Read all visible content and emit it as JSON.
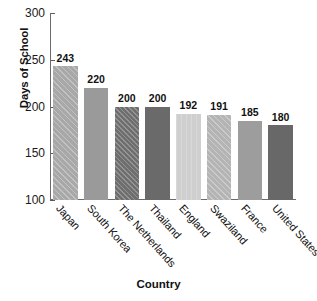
{
  "chart_data": {
    "type": "bar",
    "title": "",
    "xlabel": "Country",
    "ylabel": "Days of School",
    "categories": [
      "Japan",
      "South Korea",
      "The Netherlands",
      "Thailand",
      "England",
      "Swaziland",
      "France",
      "United States"
    ],
    "values": [
      243,
      220,
      200,
      200,
      192,
      191,
      185,
      180
    ],
    "value_labels": [
      "243",
      "220",
      "200",
      "200",
      "192",
      "191",
      "185",
      "180"
    ],
    "ylim": [
      100,
      300
    ],
    "ytick_labels": [
      "300",
      "250",
      "200",
      "150",
      "100"
    ],
    "ytick_values": [
      300,
      250,
      200,
      150,
      100
    ],
    "grid": false,
    "legend": false,
    "bar_styles": [
      {
        "color": "#a8a8a8",
        "pattern": "hatch-diag-light"
      },
      {
        "color": "#9a9a9a",
        "pattern": "hatch-none"
      },
      {
        "color": "#6e6e6e",
        "pattern": "hatch-diag-strong"
      },
      {
        "color": "#6a6a6a",
        "pattern": "hatch-none"
      },
      {
        "color": "#cfcfcf",
        "pattern": "hatch-vert"
      },
      {
        "color": "#b4b4b4",
        "pattern": "hatch-diag-light"
      },
      {
        "color": "#9d9d9d",
        "pattern": "hatch-none"
      },
      {
        "color": "#686868",
        "pattern": "hatch-none"
      }
    ],
    "xtick_rotation": 48
  }
}
